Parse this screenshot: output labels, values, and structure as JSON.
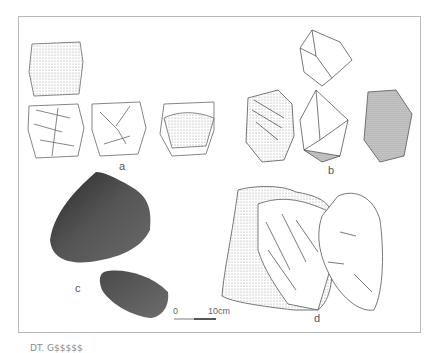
{
  "figure": {
    "panels": [
      {
        "id": "a",
        "label": "a",
        "description": "Line drawings of stone core, four views"
      },
      {
        "id": "b",
        "label": "b",
        "description": "Line drawings of stone tool, four views with stippled shading"
      },
      {
        "id": "c",
        "label": "c",
        "description": "Photographs of dark stone tool, two views"
      },
      {
        "id": "d",
        "label": "d",
        "description": "Stippled drawing and outline drawing of large stone tool"
      }
    ],
    "scale_bar": {
      "start_label": "0",
      "end_label": "10cm"
    },
    "caption": "DT. G$$$$$"
  },
  "colors": {
    "frame_border": "#b9b9b9",
    "line": "#555555",
    "photo_dark": "#3a3a3a",
    "photo_mid": "#5f5f5f"
  }
}
